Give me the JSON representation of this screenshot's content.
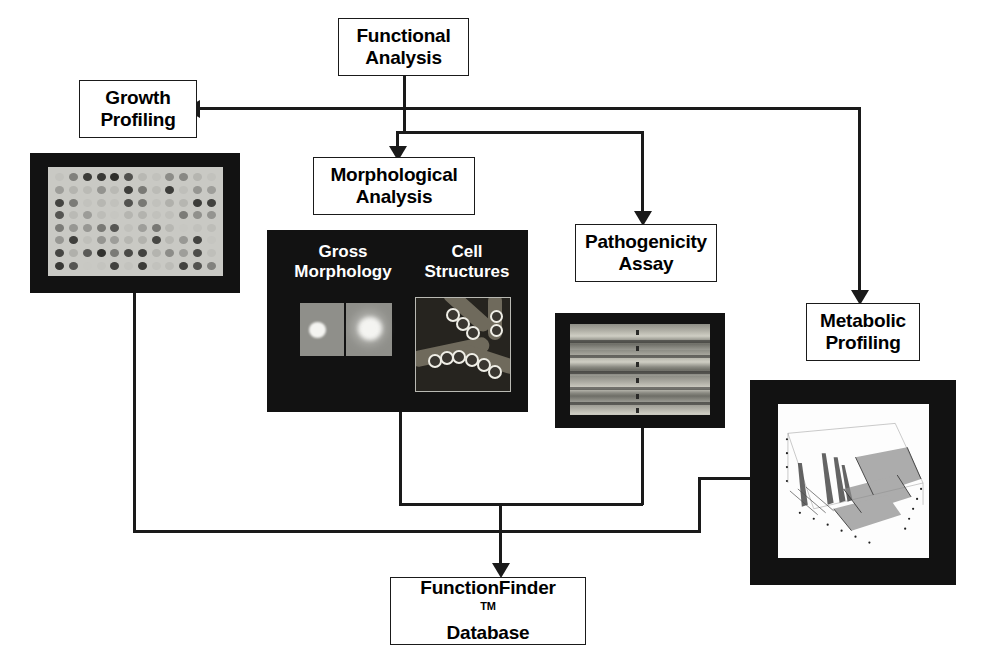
{
  "diagram": {
    "type": "flowchart",
    "background_color": "#ffffff",
    "line_color": "#1a1a1a",
    "box_fill": "#ffffff"
  },
  "nodes": {
    "functional_analysis": {
      "line1": "Functional",
      "line2": "Analysis"
    },
    "growth_profiling": {
      "line1": "Growth",
      "line2": "Profiling"
    },
    "morphological_analysis": {
      "line1": "Morphological",
      "line2": "Analysis"
    },
    "pathogenicity_assay": {
      "line1": "Pathogenicity",
      "line2": "Assay"
    },
    "metabolic_profiling": {
      "line1": "Metabolic",
      "line2": "Profiling"
    },
    "functionfinder_database": {
      "line1": "FunctionFinder",
      "trademark": "TM",
      "line2": "Database"
    }
  },
  "panels": {
    "growth_plate": {
      "caption": "",
      "description": "microtiter plate assay image"
    },
    "morphology": {
      "label_gross": "Gross\nMorphology",
      "label_cells": "Cell\nStructures"
    },
    "pathogenicity_leaf": {
      "caption": "",
      "description": "striped plant tissue image"
    },
    "metabolic_chromatogram": {
      "caption": "",
      "description": "3D chromatogram surface plot"
    }
  },
  "edges": [
    {
      "from": "functional_analysis",
      "to": "growth_profiling",
      "arrow": "left"
    },
    {
      "from": "functional_analysis",
      "to": "morphological_analysis",
      "arrow": "down"
    },
    {
      "from": "functional_analysis",
      "to": "pathogenicity_assay",
      "arrow": "down"
    },
    {
      "from": "functional_analysis",
      "to": "metabolic_profiling",
      "arrow": "down"
    },
    {
      "from": "growth_plate",
      "to": "functionfinder_database",
      "arrow": "down"
    },
    {
      "from": "morphology",
      "to": "functionfinder_database",
      "arrow": "down"
    },
    {
      "from": "pathogenicity_leaf",
      "to": "functionfinder_database",
      "arrow": "down"
    },
    {
      "from": "metabolic_chromatogram",
      "to": "functionfinder_database",
      "arrow": "down"
    }
  ]
}
